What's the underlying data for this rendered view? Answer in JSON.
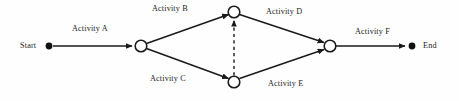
{
  "diagram": {
    "background_color": "#fefefe",
    "line_color": "#1a1a1a",
    "canvas": {
      "width": 459,
      "height": 101
    },
    "terminals": [
      {
        "id": "start",
        "label": "Start",
        "shape": "filled-dot",
        "x": 49,
        "y": 46
      },
      {
        "id": "end",
        "label": "End",
        "shape": "filled-dot",
        "x": 412,
        "y": 46
      }
    ],
    "nodes": [
      {
        "id": "n1",
        "shape": "circle",
        "x": 141,
        "y": 46,
        "r": 6
      },
      {
        "id": "n2",
        "shape": "circle",
        "x": 234,
        "y": 12,
        "r": 6
      },
      {
        "id": "n3",
        "shape": "circle",
        "x": 234,
        "y": 82,
        "r": 6
      },
      {
        "id": "n4",
        "shape": "circle",
        "x": 330,
        "y": 46,
        "r": 6
      }
    ],
    "edges": [
      {
        "id": "a",
        "label": "Activity A",
        "from": "start",
        "to": "n1",
        "style": "solid",
        "arrow": true,
        "label_x": 72,
        "label_y": 24
      },
      {
        "id": "b",
        "label": "Activity B",
        "from": "n1",
        "to": "n2",
        "style": "solid",
        "arrow": true,
        "label_x": 152,
        "label_y": 4
      },
      {
        "id": "c",
        "label": "Activity C",
        "from": "n1",
        "to": "n3",
        "style": "solid",
        "arrow": true,
        "label_x": 150,
        "label_y": 74
      },
      {
        "id": "dummy",
        "label": "",
        "from": "n3",
        "to": "n2",
        "style": "dashed",
        "arrow": true,
        "label_x": 0,
        "label_y": 0
      },
      {
        "id": "d",
        "label": "Activity D",
        "from": "n2",
        "to": "n4",
        "style": "solid",
        "arrow": true,
        "label_x": 266,
        "label_y": 7
      },
      {
        "id": "e",
        "label": "Activity E",
        "from": "n3",
        "to": "n4",
        "style": "solid",
        "arrow": true,
        "label_x": 268,
        "label_y": 79
      },
      {
        "id": "f",
        "label": "Activity F",
        "from": "n4",
        "to": "end",
        "style": "solid",
        "arrow": true,
        "label_x": 355,
        "label_y": 27
      }
    ]
  }
}
